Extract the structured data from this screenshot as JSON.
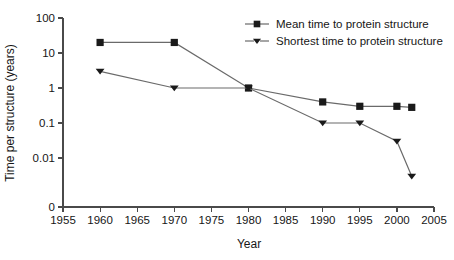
{
  "chart_data": {
    "type": "line",
    "title": "",
    "subtitle": "",
    "xlabel": "Year",
    "ylabel": "Time per structure (years)",
    "xlim": [
      1955,
      2005
    ],
    "ylim": [
      0.01,
      100
    ],
    "yscale": "log",
    "y_axis_has_zero_break": true,
    "grid": false,
    "legend_position": "top-right",
    "xticks": [
      1955,
      1960,
      1965,
      1970,
      1975,
      1980,
      1985,
      1990,
      1995,
      2000,
      2005
    ],
    "xtick_labels": [
      "1955",
      "1960",
      "1965",
      "1970",
      "1975",
      "1980",
      "1985",
      "1990",
      "1995",
      "2000",
      "2005"
    ],
    "yticks": [
      100,
      10,
      1,
      0.1,
      0.01,
      0
    ],
    "ytick_labels": [
      "100",
      "10",
      "1",
      "0.1",
      "0.01",
      "0"
    ],
    "series": [
      {
        "name": "Mean time to protein structure",
        "marker": "square",
        "x": [
          1960,
          1970,
          1980,
          1990,
          1995,
          2000,
          2002
        ],
        "values": [
          20,
          20,
          1,
          0.4,
          0.3,
          0.3,
          0.28
        ]
      },
      {
        "name": "Shortest time to protein structure",
        "marker": "triangle-down",
        "x": [
          1960,
          1970,
          1980,
          1990,
          1995,
          2000,
          2002
        ],
        "values": [
          3,
          1,
          1,
          0.1,
          0.1,
          0.03,
          0.003
        ]
      }
    ]
  },
  "legend": {
    "entries": [
      {
        "label": "Mean time to protein structure",
        "marker": "square"
      },
      {
        "label": "Shortest time to protein structure",
        "marker": "triangle-down"
      }
    ]
  }
}
